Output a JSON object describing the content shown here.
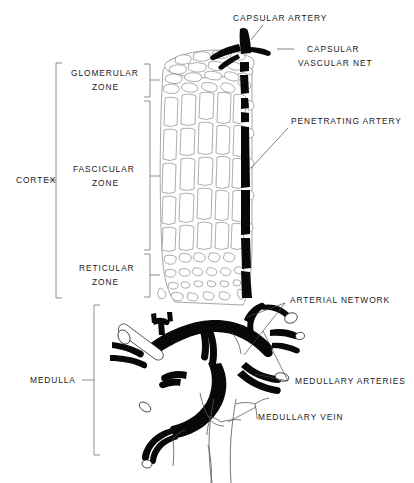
{
  "figure": {
    "background_color": "#ffffff",
    "ink_color": "#080808",
    "outline_color": "#8a8a8a",
    "width": 414,
    "height": 483
  },
  "labels": {
    "capsular_artery": "CAPSULAR ARTERY",
    "capsular_vascular_net_line1": "CAPSULAR",
    "capsular_vascular_net_line2": "VASCULAR NET",
    "penetrating_artery": "PENETRATING ARTERY",
    "arterial_network": "ARTERIAL NETWORK",
    "medullary_arteries": "MEDULLARY ARTERIES",
    "medullary_vein": "MEDULLARY VEIN",
    "cortex": "CORTEX",
    "medulla": "MEDULLA",
    "glomerular_zone_line1": "GLOMERULAR",
    "glomerular_zone_line2": "ZONE",
    "fascicular_zone_line1": "FASCICULAR",
    "fascicular_zone_line2": "ZONE",
    "reticular_zone_line1": "RETICULAR",
    "reticular_zone_line2": "ZONE"
  },
  "regions": [
    {
      "name": "cortex",
      "label": "CORTEX",
      "side": "left",
      "span_top": 63,
      "span_bottom": 298
    },
    {
      "name": "medulla",
      "label": "MEDULLA",
      "side": "left",
      "span_top": 305,
      "span_bottom": 455
    },
    {
      "name": "glomerular-zone",
      "label": "GLOMERULAR ZONE",
      "side": "left-inner",
      "span_top": 63,
      "span_bottom": 98
    },
    {
      "name": "fascicular-zone",
      "label": "FASCICULAR ZONE",
      "side": "left-inner",
      "span_top": 98,
      "span_bottom": 252
    },
    {
      "name": "reticular-zone",
      "label": "RETICULAR ZONE",
      "side": "left-inner",
      "span_top": 252,
      "span_bottom": 298
    }
  ],
  "structures": [
    {
      "name": "capsular-artery",
      "style": "solid-black",
      "description": "dark artery entering at top of capsule"
    },
    {
      "name": "capsular-vascular-net",
      "style": "outline-mesh",
      "description": "polygonal mesh over capsule surface"
    },
    {
      "name": "penetrating-artery",
      "style": "solid-black",
      "description": "vertical dark vessel descending through cortex"
    },
    {
      "name": "arterial-network",
      "style": "solid-black",
      "description": "branching dark arteries below cortex"
    },
    {
      "name": "medullary-arteries",
      "style": "solid-black",
      "description": "dark arterial branches within medulla"
    },
    {
      "name": "medullary-vein",
      "style": "outline",
      "description": "white outlined vein descending at bottom center"
    },
    {
      "name": "cortical-capillary-mesh",
      "style": "outline-mesh",
      "description": "elongated capillary loops of cortex"
    }
  ]
}
